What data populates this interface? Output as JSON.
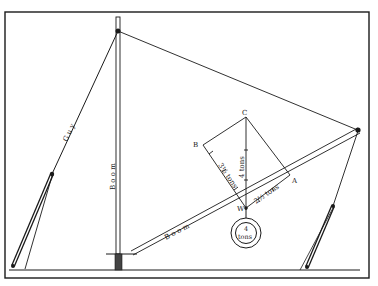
{
  "diagram": {
    "type": "crane force diagram (derrick with guy, boom and mast)",
    "labels": {
      "guy": "G u y",
      "mast": "B o o m",
      "boom": "B o o m",
      "point_b": "B",
      "point_c": "C",
      "point_a": "A",
      "point_w": "W",
      "force_bw": "3½ tons",
      "force_cw": "4  tons",
      "force_wa": "2½ tons",
      "weight_top": "4",
      "weight_bottom": "tons"
    },
    "colors": {
      "ink": "#1a1a1a",
      "paper": "#ffffff"
    }
  }
}
